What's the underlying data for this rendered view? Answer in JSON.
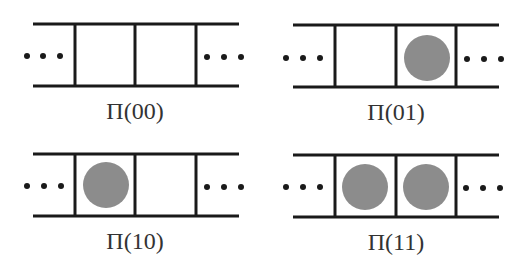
{
  "diagram": {
    "colors": {
      "line": "#1a1a1a",
      "particle": "#8c8c8c",
      "label": "#333333",
      "background": "#ffffff"
    },
    "ellipsis": "...",
    "panels": [
      {
        "id": "00",
        "label": "Π(00)",
        "cells": [
          false,
          false
        ]
      },
      {
        "id": "01",
        "label": "Π(01)",
        "cells": [
          false,
          true
        ]
      },
      {
        "id": "10",
        "label": "Π(10)",
        "cells": [
          true,
          false
        ]
      },
      {
        "id": "11",
        "label": "Π(11)",
        "cells": [
          true,
          true
        ]
      }
    ]
  }
}
